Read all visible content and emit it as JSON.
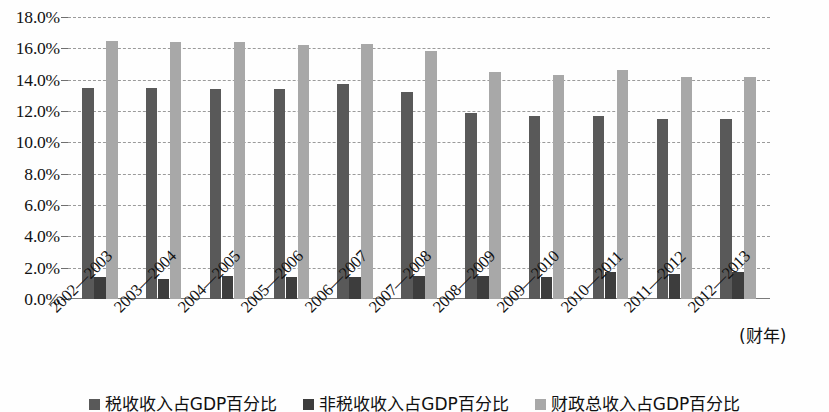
{
  "chart_data": {
    "type": "bar",
    "title": "",
    "xlabel": "(财年)",
    "ylabel": "",
    "ylim": [
      0,
      18
    ],
    "ytick_labels": [
      "18.0%",
      "16.0%",
      "14.0%",
      "12.0%",
      "10.0%",
      "8.0%",
      "6.0%",
      "4.0%",
      "2.0%",
      "0.0%"
    ],
    "yticks": [
      18,
      16,
      14,
      12,
      10,
      8,
      6,
      4,
      2,
      0
    ],
    "grid": true,
    "legend_position": "bottom",
    "categories": [
      "2002—2003",
      "2003—2004",
      "2004—2005",
      "2005—2006",
      "2006—2007",
      "2007—2008",
      "2008—2009",
      "2009—2010",
      "2010—2011",
      "2011—2012",
      "2012—2013"
    ],
    "series": [
      {
        "name": "税收收入占GDP百分比",
        "color": "#595959",
        "values": [
          13.5,
          13.5,
          13.4,
          13.4,
          13.7,
          13.2,
          11.9,
          11.7,
          11.7,
          11.5,
          11.5
        ]
      },
      {
        "name": "非税收收入占GDP百分比",
        "color": "#3d3d3d",
        "values": [
          1.4,
          1.3,
          1.5,
          1.4,
          1.4,
          1.5,
          1.5,
          1.4,
          1.7,
          1.6,
          1.7
        ]
      },
      {
        "name": "财政总收入占GDP百分比",
        "color": "#a8a8a8",
        "values": [
          16.5,
          16.4,
          16.4,
          16.2,
          16.3,
          15.8,
          14.5,
          14.3,
          14.6,
          14.2,
          14.2
        ]
      }
    ]
  },
  "axis": {
    "unit_label": "(财年)"
  }
}
